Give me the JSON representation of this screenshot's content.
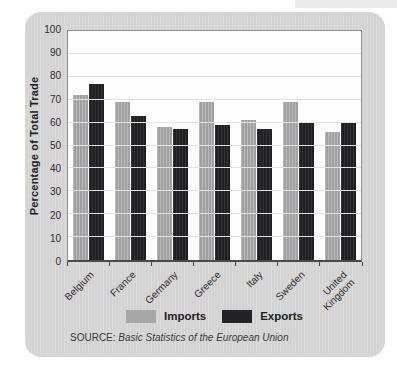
{
  "chart_data": {
    "type": "bar",
    "title": "",
    "xlabel": "",
    "ylabel": "Percentage of Total Trade",
    "ylim": [
      0,
      100
    ],
    "ytick_step": 10,
    "grid": true,
    "legend_position": "bottom",
    "categories": [
      {
        "name": "Belgium",
        "lines": [
          "Belgium"
        ]
      },
      {
        "name": "France",
        "lines": [
          "France"
        ]
      },
      {
        "name": "Germany",
        "lines": [
          "Germany"
        ]
      },
      {
        "name": "Greece",
        "lines": [
          "Greece"
        ]
      },
      {
        "name": "Italy",
        "lines": [
          "Italy"
        ]
      },
      {
        "name": "Sweden",
        "lines": [
          "Sweden"
        ]
      },
      {
        "name": "United Kingdom",
        "lines": [
          "United",
          "Kingdom"
        ]
      }
    ],
    "series": [
      {
        "name": "Imports",
        "color": "#a7a7a7",
        "values": [
          72,
          69,
          58,
          69,
          61,
          69,
          56
        ]
      },
      {
        "name": "Exports",
        "color": "#232327",
        "values": [
          77,
          63,
          57,
          59,
          57,
          60,
          60
        ]
      }
    ]
  },
  "source": {
    "prefix": "SOURCE: ",
    "title": "Basic Statistics of the European Union"
  },
  "colors": {
    "card_background": "#d6d6d6",
    "plot_background": "#fdfdfd",
    "gridline": "#e3e3e3",
    "axis": "#4a4a4a",
    "imports_bar": "#a7a7a7",
    "exports_bar": "#232327",
    "text": "#2e2e2e"
  }
}
